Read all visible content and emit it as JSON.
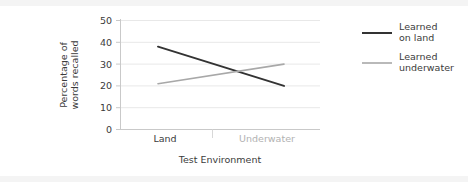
{
  "chart_data": {
    "type": "line",
    "title": "",
    "xlabel": "Test Environment",
    "ylabel_line1": "Percentage of",
    "ylabel_line2": "words recalled",
    "categories": [
      "Land",
      "Underwater"
    ],
    "ylim": [
      0,
      50
    ],
    "yticks": [
      0,
      10,
      20,
      30,
      40,
      50
    ],
    "ytick_labels": [
      "0",
      "10",
      "20",
      "30",
      "40",
      "50"
    ],
    "grid": "horizontal",
    "legend_position": "right",
    "series": [
      {
        "name": "Learned on land",
        "legend_line1": "Learned",
        "legend_line2": "on land",
        "color": "#333333",
        "values": [
          38,
          20
        ]
      },
      {
        "name": "Learned underwater",
        "legend_line1": "Learned",
        "legend_line2": "underwater",
        "color": "#a8a8a8",
        "values": [
          21,
          30
        ]
      }
    ]
  },
  "axis": {
    "y_tick_0": "0",
    "y_tick_1": "10",
    "y_tick_2": "20",
    "y_tick_3": "30",
    "y_tick_4": "40",
    "y_tick_5": "50",
    "x_tick_0": "Land",
    "x_tick_1": "Underwater",
    "x_title": "Test Environment",
    "y_title_line1": "Percentage of",
    "y_title_line2": "words recalled"
  },
  "legend": {
    "item_0_line1": "Learned",
    "item_0_line2": "on land",
    "item_1_line1": "Learned",
    "item_1_line2": "underwater"
  },
  "colors": {
    "series_land": "#333333",
    "series_underwater": "#a8a8a8",
    "grid": "#e8e8e8",
    "axis": "#c9c9c9",
    "text": "#3b3b3b",
    "text_muted": "#b2b2b2",
    "background": "#ffffff",
    "band": "#f4f4f4"
  }
}
